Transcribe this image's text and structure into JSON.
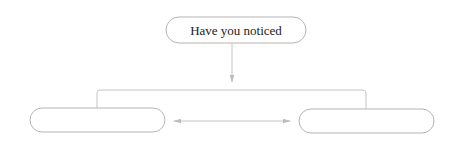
{
  "diagram": {
    "top_node": {
      "label": "Have you noticed"
    },
    "left_node": {
      "label": ""
    },
    "right_node": {
      "label": ""
    },
    "connections": [
      {
        "from": "top_node",
        "to": "branch",
        "type": "arrow"
      },
      {
        "from": "branch",
        "to": "left_node",
        "type": "line"
      },
      {
        "from": "branch",
        "to": "right_node",
        "type": "line"
      },
      {
        "from": "left_node",
        "to": "right_node",
        "type": "double-arrow"
      }
    ],
    "colors": {
      "stroke": "#b8b8b8",
      "arrow": "#c4c4c4",
      "text": "#222222"
    }
  }
}
